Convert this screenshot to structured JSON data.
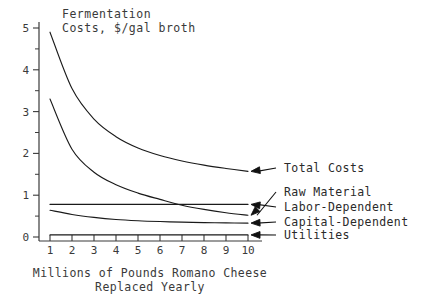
{
  "chart_data": {
    "type": "line",
    "title": "Fermentation Costs, $/gal broth",
    "title_line1": "Fermentation",
    "title_line2": "Costs, $/gal broth",
    "xlabel": "Millions of Pounds Romano Cheese Replaced Yearly",
    "xlabel_line1": "Millions of Pounds Romano Cheese",
    "xlabel_line2": "Replaced Yearly",
    "ylabel": "Fermentation Costs, $/gal broth",
    "xlim": [
      1,
      10
    ],
    "ylim": [
      0,
      5
    ],
    "grid": false,
    "legend_position": "right-inline-annotations",
    "x": [
      1,
      2,
      3,
      4,
      5,
      6,
      7,
      8,
      9,
      10
    ],
    "xticks": [
      "1",
      "2",
      "3",
      "4",
      "5",
      "6",
      "7",
      "8",
      "9",
      "10"
    ],
    "yticks": [
      "0",
      "1",
      "2",
      "3",
      "4",
      "5"
    ],
    "ytick_minor_step": 0.5,
    "series": [
      {
        "name": "Total Costs",
        "values": [
          4.9,
          3.55,
          2.82,
          2.4,
          2.13,
          1.95,
          1.82,
          1.72,
          1.64,
          1.57
        ]
      },
      {
        "name": "Raw Material",
        "values": [
          3.3,
          2.1,
          1.55,
          1.25,
          1.05,
          0.9,
          0.76,
          0.66,
          0.58,
          0.52
        ]
      },
      {
        "name": "Labor-Dependent",
        "values": [
          0.78,
          0.78,
          0.78,
          0.78,
          0.78,
          0.78,
          0.78,
          0.78,
          0.78,
          0.78
        ]
      },
      {
        "name": "Capital-Dependent",
        "values": [
          0.64,
          0.54,
          0.47,
          0.42,
          0.39,
          0.37,
          0.355,
          0.345,
          0.338,
          0.332
        ]
      },
      {
        "name": "Utilities",
        "values": [
          0.05,
          0.05,
          0.05,
          0.05,
          0.05,
          0.05,
          0.05,
          0.05,
          0.05,
          0.05
        ]
      }
    ],
    "annotations": [
      {
        "label": "Total Costs",
        "points_to_series": "Total Costs"
      },
      {
        "label": "Raw Material",
        "points_to_series": "Raw Material"
      },
      {
        "label": "Labor-Dependent",
        "points_to_series": "Labor-Dependent"
      },
      {
        "label": "Capital-Dependent",
        "points_to_series": "Capital-Dependent"
      },
      {
        "label": "Utilities",
        "points_to_series": "Utilities"
      }
    ]
  },
  "colors": {
    "ink": "#1a1a1a",
    "axis": "#3a3a3a",
    "background": "#ffffff"
  }
}
